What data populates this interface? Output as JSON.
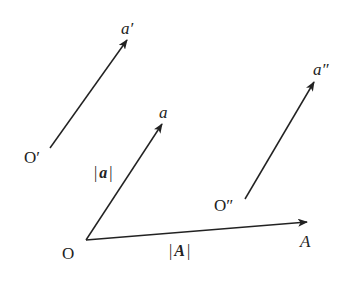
{
  "diagram": {
    "stroke_color": "#222222",
    "background": "#ffffff",
    "points": {
      "O": {
        "label": "O",
        "x": 86,
        "y": 240
      },
      "O1": {
        "label": "O′",
        "x": 50,
        "y": 148
      },
      "O2": {
        "label": "O″",
        "x": 245,
        "y": 199
      }
    },
    "vectors": [
      {
        "id": "a",
        "tail": [
          86,
          240
        ],
        "head": [
          162,
          124
        ],
        "head_label": "a"
      },
      {
        "id": "a1",
        "tail": [
          50,
          148
        ],
        "head": [
          127,
          40
        ],
        "head_label": "a′"
      },
      {
        "id": "a2",
        "tail": [
          245,
          199
        ],
        "head": [
          314,
          82
        ],
        "head_label": "a″"
      },
      {
        "id": "A",
        "tail": [
          86,
          240
        ],
        "head": [
          307,
          222
        ],
        "head_label": "A"
      }
    ],
    "labels": {
      "origin": "O",
      "origin_prime": "O′",
      "origin_double_prime": "O″",
      "vec_a": "a",
      "vec_a_prime": "a′",
      "vec_a_double_prime": "a″",
      "vec_A": "A",
      "mag_a_bar": "|",
      "mag_a_sym": "a",
      "mag_A_bar": "|",
      "mag_A_sym": "A"
    }
  }
}
